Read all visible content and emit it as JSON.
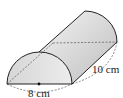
{
  "figure": {
    "type": "half-cylinder",
    "labels": {
      "diameter": "8 cm",
      "length": "10 cm"
    },
    "colors": {
      "fill_light": "#ececec",
      "fill_dark": "#c8c8c8",
      "stroke": "#222222",
      "dashed": "#555555"
    }
  }
}
